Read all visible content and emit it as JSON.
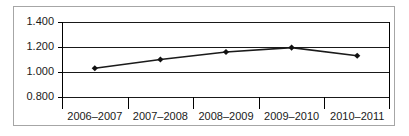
{
  "chart_data": {
    "type": "line",
    "title": "",
    "subtitle": "",
    "xlabel": "",
    "ylabel": "",
    "categories": [
      "2006–2007",
      "2007–2008",
      "2008–2009",
      "2009–2010",
      "2010–2011"
    ],
    "series": [
      {
        "name": "",
        "values": [
          1.03,
          1.1,
          1.16,
          1.195,
          1.13
        ]
      }
    ],
    "ylim": [
      0.8,
      1.4
    ],
    "ytick_values": [
      1.4,
      1.2,
      1.0,
      0.8
    ],
    "ytick_labels": [
      "1.400",
      "1.200",
      "1.000",
      "0.800"
    ],
    "grid": true,
    "grid_axis": "y",
    "legend": false,
    "legend_position": "none",
    "marker": "diamond",
    "line_color": "#1a1a1a",
    "marker_color": "#111111",
    "grid_color": "#000000",
    "frame_color": "#a6a6a6",
    "background_color": "#ffffff",
    "annotations": []
  },
  "frame": {
    "border_label": "chart-border"
  }
}
